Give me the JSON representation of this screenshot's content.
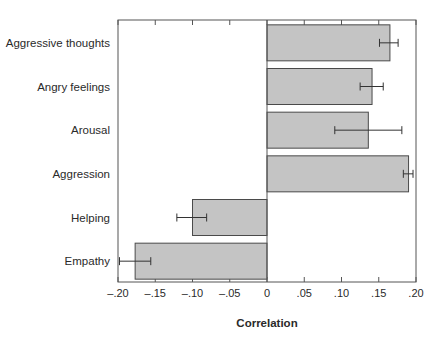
{
  "chart_data": {
    "type": "bar",
    "orientation": "horizontal",
    "title": "",
    "xlabel": "Correlation",
    "ylabel": "",
    "xlim": [
      -0.2,
      0.2
    ],
    "grid": false,
    "legend": null,
    "categories": [
      "Aggressive thoughts",
      "Angry feelings",
      "Arousal",
      "Aggression",
      "Helping",
      "Empathy"
    ],
    "values": [
      0.165,
      0.141,
      0.136,
      0.19,
      -0.1,
      -0.177
    ],
    "error_bars": [
      {
        "low": 0.151,
        "high": 0.176
      },
      {
        "low": 0.125,
        "high": 0.156
      },
      {
        "low": 0.091,
        "high": 0.181
      },
      {
        "low": 0.183,
        "high": 0.196
      },
      {
        "low": -0.121,
        "high": -0.081
      },
      {
        "low": -0.198,
        "high": -0.156
      }
    ],
    "x_ticks": [
      -0.2,
      -0.15,
      -0.1,
      -0.05,
      0,
      0.05,
      0.1,
      0.15,
      0.2
    ],
    "x_tick_labels": [
      "–.20",
      "–.15",
      "–.10",
      "–.05",
      "0",
      ".05",
      ".10",
      ".15",
      ".20"
    ],
    "colors": {
      "bar_fill": "#c4c4c4",
      "bar_stroke": "#4a4a4a",
      "axis": "#555555",
      "error": "#333333"
    }
  }
}
